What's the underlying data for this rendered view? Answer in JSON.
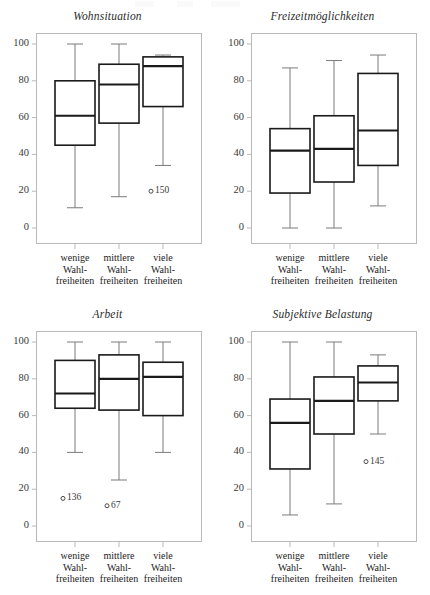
{
  "figure": {
    "width": 430,
    "height": 595,
    "background": "#ffffff",
    "frame_color": "#b9b9b9",
    "box_color": "#1a1a1a",
    "whisker_color": "#7a7a7a"
  },
  "axis": {
    "y_ticks": [
      "100",
      "80",
      "60",
      "40",
      "20",
      "0"
    ],
    "y_values": [
      100,
      80,
      60,
      40,
      20,
      0
    ],
    "ylim": [
      0,
      105
    ],
    "x_categories": [
      [
        "wenige",
        "Wahl-",
        "freiheiten"
      ],
      [
        "mittlere",
        "Wahl-",
        "freiheiten"
      ],
      [
        "viele",
        "Wahl-",
        "freiheiten"
      ]
    ]
  },
  "chart_data": [
    {
      "type": "box",
      "title": "Wohnsituation",
      "xlabel": "",
      "ylabel": "",
      "ylim": [
        0,
        105
      ],
      "grid": false,
      "legend": "none",
      "categories": [
        "wenige Wahlfreiheiten",
        "mittlere Wahlfreiheiten",
        "viele Wahlfreiheiten"
      ],
      "boxes": [
        {
          "category": "wenige Wahlfreiheiten",
          "min": 11,
          "q1": 45,
          "median": 61,
          "q3": 80,
          "max": 100
        },
        {
          "category": "mittlere Wahlfreiheiten",
          "min": 17,
          "q1": 57,
          "median": 78,
          "q3": 89,
          "max": 100
        },
        {
          "category": "viele Wahlfreiheiten",
          "min": 34,
          "q1": 66,
          "median": 88,
          "q3": 93,
          "max": 94
        }
      ],
      "outliers": [
        {
          "category": "viele Wahlfreiheiten",
          "label": "150",
          "value": 20,
          "marker": "circle"
        }
      ]
    },
    {
      "type": "box",
      "title": "Freizeitmöglichkeiten",
      "xlabel": "",
      "ylabel": "",
      "ylim": [
        0,
        105
      ],
      "grid": false,
      "legend": "none",
      "categories": [
        "wenige Wahlfreiheiten",
        "mittlere Wahlfreiheiten",
        "viele Wahlfreiheiten"
      ],
      "boxes": [
        {
          "category": "wenige Wahlfreiheiten",
          "min": 0,
          "q1": 19,
          "median": 42,
          "q3": 54,
          "max": 87
        },
        {
          "category": "mittlere Wahlfreiheiten",
          "min": 0,
          "q1": 25,
          "median": 43,
          "q3": 61,
          "max": 91
        },
        {
          "category": "viele Wahlfreiheiten",
          "min": 12,
          "q1": 34,
          "median": 53,
          "q3": 84,
          "max": 94
        }
      ],
      "outliers": []
    },
    {
      "type": "box",
      "title": "Arbeit",
      "xlabel": "",
      "ylabel": "",
      "ylim": [
        0,
        105
      ],
      "grid": false,
      "legend": "none",
      "categories": [
        "wenige Wahlfreiheiten",
        "mittlere Wahlfreiheiten",
        "viele Wahlfreiheiten"
      ],
      "boxes": [
        {
          "category": "wenige Wahlfreiheiten",
          "min": 40,
          "q1": 64,
          "median": 72,
          "q3": 90,
          "max": 100
        },
        {
          "category": "mittlere Wahlfreiheiten",
          "min": 25,
          "q1": 63,
          "median": 80,
          "q3": 93,
          "max": 100
        },
        {
          "category": "viele Wahlfreiheiten",
          "min": 40,
          "q1": 60,
          "median": 81,
          "q3": 89,
          "max": 100
        }
      ],
      "outliers": [
        {
          "category": "wenige Wahlfreiheiten",
          "label": "136",
          "value": 15,
          "marker": "circle"
        },
        {
          "category": "mittlere Wahlfreiheiten",
          "label": "67",
          "value": 11,
          "marker": "circle"
        }
      ]
    },
    {
      "type": "box",
      "title": "Subjektive Belastung",
      "xlabel": "",
      "ylabel": "",
      "ylim": [
        0,
        105
      ],
      "grid": false,
      "legend": "none",
      "categories": [
        "wenige Wahlfreiheiten",
        "mittlere Wahlfreiheiten",
        "viele Wahlfreiheiten"
      ],
      "boxes": [
        {
          "category": "wenige Wahlfreiheiten",
          "min": 6,
          "q1": 31,
          "median": 56,
          "q3": 69,
          "max": 100
        },
        {
          "category": "mittlere Wahlfreiheiten",
          "min": 12,
          "q1": 50,
          "median": 68,
          "q3": 81,
          "max": 100
        },
        {
          "category": "viele Wahlfreiheiten",
          "min": 50,
          "q1": 68,
          "median": 78,
          "q3": 87,
          "max": 93
        }
      ],
      "outliers": [
        {
          "category": "viele Wahlfreiheiten",
          "label": "145",
          "value": 35,
          "marker": "circle"
        }
      ]
    }
  ]
}
